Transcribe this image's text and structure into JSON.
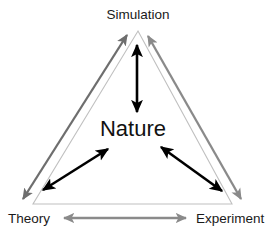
{
  "diagram": {
    "title": "Nature",
    "center_node": {
      "id": "nature",
      "label": "Nature"
    },
    "corner_nodes": [
      {
        "id": "simulation",
        "label": "Simulation",
        "position": "top"
      },
      {
        "id": "theory",
        "label": "Theory",
        "position": "bottom-left"
      },
      {
        "id": "experiment",
        "label": "Experiment",
        "position": "bottom-right"
      }
    ],
    "edges": [
      {
        "id": "nature-simulation",
        "from": "Nature",
        "to": "Simulation",
        "style": "double-arrow",
        "color": "#000000"
      },
      {
        "id": "nature-theory",
        "from": "Nature",
        "to": "Theory",
        "style": "double-arrow",
        "color": "#000000"
      },
      {
        "id": "nature-experiment",
        "from": "Nature",
        "to": "Experiment",
        "style": "double-arrow",
        "color": "#000000"
      },
      {
        "id": "theory-simulation",
        "from": "Theory",
        "to": "Simulation",
        "style": "double-arrow",
        "color": "#6e6e6e"
      },
      {
        "id": "simulation-experiment",
        "from": "Simulation",
        "to": "Experiment",
        "style": "double-arrow",
        "color": "#8a8a8a"
      },
      {
        "id": "theory-experiment",
        "from": "Theory",
        "to": "Experiment",
        "style": "double-arrow",
        "color": "#8a8a8a"
      }
    ],
    "outline": {
      "id": "triangle-outline",
      "shape": "triangle",
      "color": "#c0c0c0"
    },
    "colors": {
      "background": "#ffffff",
      "text": "#1a1a1a",
      "inner_arrow": "#000000",
      "outer_arrow_left": "#6e6e6e",
      "outer_arrow_right": "#8a8a8a",
      "outer_arrow_bottom": "#8a8a8a",
      "triangle_outline": "#c0c0c0"
    }
  }
}
